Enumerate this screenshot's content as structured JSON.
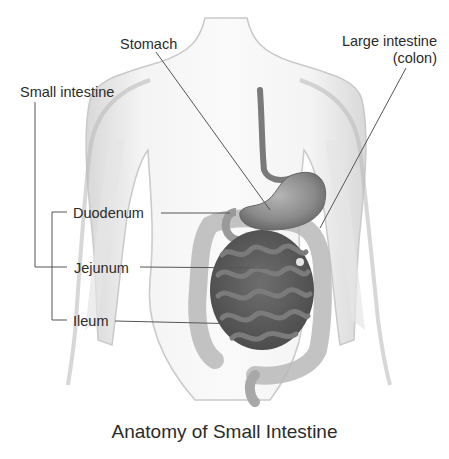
{
  "figure": {
    "title": "Anatomy of Small Intestine",
    "labels": {
      "stomach": "Stomach",
      "large_intestine_line1": "Large intestine",
      "large_intestine_line2": "(colon)",
      "small_intestine": "Small intestine",
      "duodenum": "Duodenum",
      "jejunum": "Jejunum",
      "ileum": "Ileum"
    },
    "colors": {
      "background": "#ffffff",
      "body_outline": "#c9c9c9",
      "body_fill": "#f3f3f3",
      "stomach": "#8a8a8a",
      "small_intestine": "#5f5f5f",
      "colon": "#b8b8b8",
      "leader_line": "#555555",
      "text": "#2b2b2b"
    }
  }
}
